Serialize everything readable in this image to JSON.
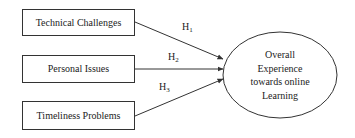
{
  "diagram": {
    "type": "path-model",
    "nodes": [
      {
        "id": "technical",
        "label": "Technical Challenges",
        "shape": "rectangle"
      },
      {
        "id": "personal",
        "label": "Personal Issues",
        "shape": "rectangle"
      },
      {
        "id": "timeliness",
        "label": "Timeliness Problems",
        "shape": "rectangle"
      },
      {
        "id": "outcome",
        "label": "Overall Experience towards online Learning",
        "shape": "ellipse",
        "lines": [
          "Overall",
          "Experience",
          "towards online",
          "Learning"
        ]
      }
    ],
    "edges": [
      {
        "from": "technical",
        "to": "outcome",
        "label": "H",
        "sub": "1"
      },
      {
        "from": "personal",
        "to": "outcome",
        "label": "H",
        "sub": "2"
      },
      {
        "from": "timeliness",
        "to": "outcome",
        "label": "H",
        "sub": "3"
      }
    ],
    "colors": {
      "stroke": "#333333",
      "background": "#ffffff",
      "text": "#222222"
    }
  }
}
